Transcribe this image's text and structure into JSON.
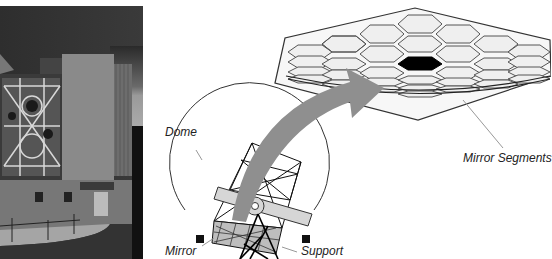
{
  "figure": {
    "photo": {
      "subject": "telescope-dome-photograph",
      "description": "Photograph of a telescope building with segmented mirror visible through open dome"
    },
    "diagram": {
      "labels": {
        "dome": "Dome",
        "mirror": "Mirror",
        "support": "Support",
        "mirror_segments": "Mirror Segments"
      },
      "segment_array": {
        "highlighted_segment_color": "#000000",
        "segment_fill": "#efefef",
        "segment_stroke": "#555555"
      },
      "arrow_color": "#8f8f8f"
    }
  }
}
